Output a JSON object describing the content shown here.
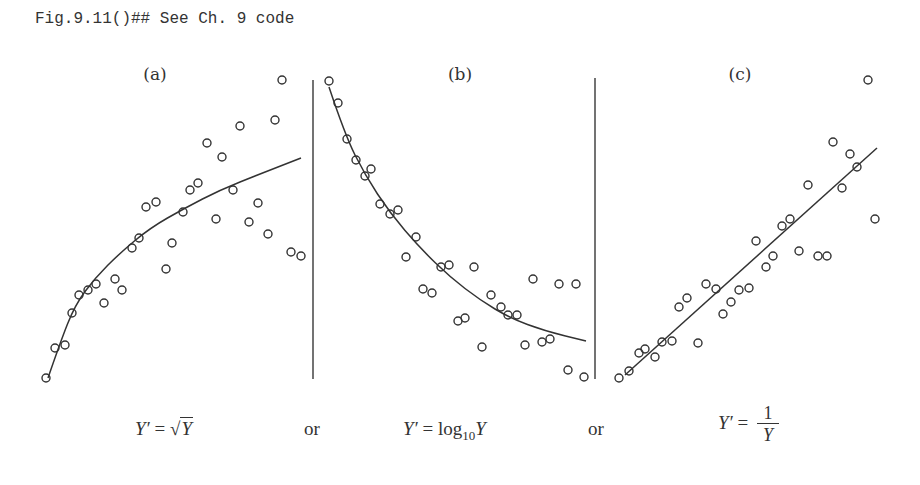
{
  "caption": "Fig.9.11()## See Ch. 9 code",
  "panels": [
    {
      "label": "(a)",
      "formula_lhs": "Y′",
      "formula_eq": "=",
      "formula_rhs_radicand": "Y",
      "transform": "square root"
    },
    {
      "label": "(b)",
      "formula_lhs": "Y′",
      "formula_eq": "=",
      "formula_rhs_func": "log",
      "formula_rhs_sub": "10",
      "formula_rhs_var": "Y",
      "transform": "log10"
    },
    {
      "label": "(c)",
      "formula_lhs": "Y′",
      "formula_eq": "=",
      "formula_num": "1",
      "formula_den": "Y",
      "transform": "reciprocal"
    }
  ],
  "separators": [
    "or",
    "or"
  ],
  "chart_data": [
    {
      "type": "scatter",
      "title": "(a)",
      "xlabel": "",
      "ylabel": "",
      "grid": false,
      "fit": "concave increasing curve (decelerating growth)",
      "annotation": "Y′ = √Y",
      "points_px": [
        [
          46,
          378
        ],
        [
          55,
          348
        ],
        [
          65,
          345
        ],
        [
          72,
          313
        ],
        [
          79,
          295
        ],
        [
          88,
          290
        ],
        [
          96,
          284
        ],
        [
          104,
          303
        ],
        [
          115,
          279
        ],
        [
          122,
          290
        ],
        [
          132,
          248
        ],
        [
          139,
          238
        ],
        [
          146,
          207
        ],
        [
          156,
          202
        ],
        [
          166,
          269
        ],
        [
          172,
          243
        ],
        [
          183,
          212
        ],
        [
          190,
          190
        ],
        [
          198,
          183
        ],
        [
          207,
          143
        ],
        [
          216,
          219
        ],
        [
          222,
          157
        ],
        [
          233,
          190
        ],
        [
          240,
          126
        ],
        [
          249,
          222
        ],
        [
          258,
          203
        ],
        [
          268,
          234
        ],
        [
          275,
          120
        ],
        [
          282,
          80
        ],
        [
          291,
          252
        ],
        [
          301,
          256
        ]
      ],
      "curve_px": [
        [
          48,
          378
        ],
        [
          60,
          343
        ],
        [
          75,
          305
        ],
        [
          95,
          278
        ],
        [
          120,
          253
        ],
        [
          150,
          228
        ],
        [
          185,
          208
        ],
        [
          220,
          190
        ],
        [
          260,
          174
        ],
        [
          301,
          158
        ]
      ]
    },
    {
      "type": "scatter",
      "title": "(b)",
      "xlabel": "",
      "ylabel": "",
      "grid": false,
      "fit": "convex decreasing curve (exponential-like decay)",
      "annotation": "Y′ = log10Y",
      "points_px": [
        [
          329,
          81
        ],
        [
          338,
          103
        ],
        [
          347,
          139
        ],
        [
          356,
          160
        ],
        [
          365,
          176
        ],
        [
          371,
          169
        ],
        [
          380,
          204
        ],
        [
          390,
          214
        ],
        [
          398,
          210
        ],
        [
          416,
          237
        ],
        [
          406,
          257
        ],
        [
          423,
          289
        ],
        [
          432,
          293
        ],
        [
          441,
          267
        ],
        [
          449,
          265
        ],
        [
          458,
          321
        ],
        [
          465,
          318
        ],
        [
          474,
          267
        ],
        [
          482,
          347
        ],
        [
          491,
          295
        ],
        [
          501,
          307
        ],
        [
          508,
          315
        ],
        [
          517,
          315
        ],
        [
          525,
          345
        ],
        [
          533,
          279
        ],
        [
          542,
          342
        ],
        [
          550,
          339
        ],
        [
          559,
          284
        ],
        [
          576,
          284
        ],
        [
          568,
          370
        ],
        [
          584,
          377
        ]
      ],
      "curve_px": [
        [
          329,
          87
        ],
        [
          345,
          135
        ],
        [
          365,
          175
        ],
        [
          390,
          213
        ],
        [
          420,
          248
        ],
        [
          450,
          277
        ],
        [
          480,
          300
        ],
        [
          510,
          318
        ],
        [
          545,
          331
        ],
        [
          586,
          341
        ]
      ]
    },
    {
      "type": "scatter",
      "title": "(c)",
      "xlabel": "",
      "ylabel": "",
      "grid": false,
      "fit": "linear increasing line",
      "annotation": "Y′ = 1/Y",
      "points_px": [
        [
          619,
          378
        ],
        [
          629,
          371
        ],
        [
          639,
          353
        ],
        [
          645,
          349
        ],
        [
          655,
          357
        ],
        [
          662,
          342
        ],
        [
          672,
          341
        ],
        [
          679,
          307
        ],
        [
          687,
          298
        ],
        [
          698,
          343
        ],
        [
          706,
          284
        ],
        [
          716,
          289
        ],
        [
          723,
          314
        ],
        [
          731,
          302
        ],
        [
          739,
          290
        ],
        [
          749,
          288
        ],
        [
          756,
          241
        ],
        [
          766,
          267
        ],
        [
          773,
          256
        ],
        [
          782,
          226
        ],
        [
          790,
          219
        ],
        [
          799,
          251
        ],
        [
          808,
          185
        ],
        [
          818,
          256
        ],
        [
          827,
          256
        ],
        [
          833,
          142
        ],
        [
          842,
          188
        ],
        [
          850,
          154
        ],
        [
          857,
          167
        ],
        [
          868,
          80
        ],
        [
          875,
          219
        ]
      ],
      "curve_px": [
        [
          625,
          375
        ],
        [
          877,
          148
        ]
      ]
    }
  ],
  "colors": {
    "ink": "#333333",
    "background": "#ffffff"
  }
}
